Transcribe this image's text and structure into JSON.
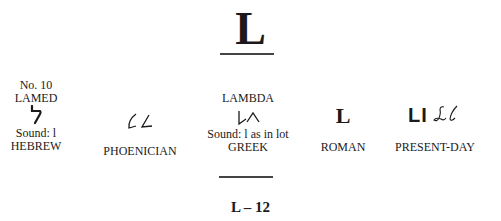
{
  "header": {
    "letter": "L"
  },
  "columns": {
    "hebrew": {
      "number": "No. 10",
      "name": "LAMED",
      "glyph": "ל",
      "sound": "Sound: l",
      "label": "HEBREW"
    },
    "phoenician": {
      "label": "PHOENICIAN"
    },
    "greek": {
      "name": "LAMBDA",
      "sound": "Sound: l as in lot",
      "label": "GREEK"
    },
    "roman": {
      "glyph": "L",
      "label": "ROMAN"
    },
    "present_day": {
      "glyph_print": "Ll",
      "glyph_script": "𝓛𝓁",
      "label": "PRESENT-DAY"
    }
  },
  "footer": {
    "page_label": "L – 12"
  }
}
